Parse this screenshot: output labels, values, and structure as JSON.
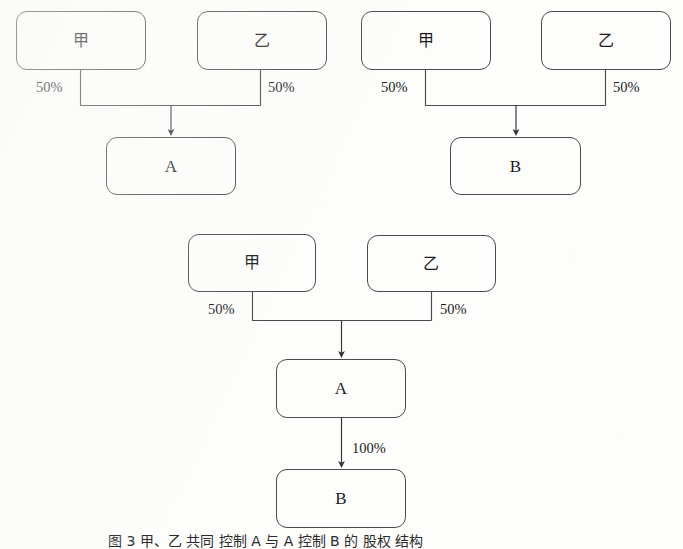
{
  "figure": {
    "caption": "图 3   甲、乙 共同 控制 A 与 A 控制 B 的 股权 结构",
    "background_color": "#fdfdfc",
    "line_color": "#4a4a4a",
    "text_color": "#1d1d1d"
  },
  "diagrams": [
    {
      "id": "diagram-top-left",
      "nodes": [
        {
          "id": "tl-parent-1",
          "label": "甲",
          "script": "cjk",
          "x": 16,
          "y": 11,
          "w": 130,
          "h": 59
        },
        {
          "id": "tl-parent-2",
          "label": "乙",
          "script": "cjk",
          "x": 197,
          "y": 11,
          "w": 130,
          "h": 59
        },
        {
          "id": "tl-child",
          "label": "A",
          "script": "latin",
          "x": 106,
          "y": 137,
          "w": 130,
          "h": 58
        }
      ],
      "edges": [
        {
          "id": "tl-edge-1",
          "from": "tl-parent-1",
          "to": "tl-child",
          "label": "50%",
          "label_side": "left",
          "label_x": 36,
          "label_y": 80
        },
        {
          "id": "tl-edge-2",
          "from": "tl-parent-2",
          "to": "tl-child",
          "label": "50%",
          "label_side": "right",
          "label_x": 268,
          "label_y": 80
        }
      ]
    },
    {
      "id": "diagram-top-right",
      "nodes": [
        {
          "id": "tr-parent-1",
          "label": "甲",
          "script": "cjk",
          "x": 361,
          "y": 11,
          "w": 130,
          "h": 59
        },
        {
          "id": "tr-parent-2",
          "label": "乙",
          "script": "cjk",
          "x": 541,
          "y": 11,
          "w": 130,
          "h": 59
        },
        {
          "id": "tr-child",
          "label": "B",
          "script": "latin",
          "x": 450,
          "y": 137,
          "w": 131,
          "h": 58
        }
      ],
      "edges": [
        {
          "id": "tr-edge-1",
          "from": "tr-parent-1",
          "to": "tr-child",
          "label": "50%",
          "label_side": "left",
          "label_x": 381,
          "label_y": 80
        },
        {
          "id": "tr-edge-2",
          "from": "tr-parent-2",
          "to": "tr-child",
          "label": "50%",
          "label_side": "right",
          "label_x": 613,
          "label_y": 80
        }
      ]
    },
    {
      "id": "diagram-bottom",
      "nodes": [
        {
          "id": "b-parent-1",
          "label": "甲",
          "script": "cjk",
          "x": 188,
          "y": 234,
          "w": 128,
          "h": 58
        },
        {
          "id": "b-parent-2",
          "label": "乙",
          "script": "cjk",
          "x": 367,
          "y": 235,
          "w": 129,
          "h": 57
        },
        {
          "id": "b-mid",
          "label": "A",
          "script": "latin",
          "x": 276,
          "y": 359,
          "w": 130,
          "h": 59
        },
        {
          "id": "b-leaf",
          "label": "B",
          "script": "latin",
          "x": 276,
          "y": 469,
          "w": 130,
          "h": 59
        }
      ],
      "edges": [
        {
          "id": "b-edge-1",
          "from": "b-parent-1",
          "to": "b-mid",
          "label": "50%",
          "label_side": "left",
          "label_x": 208,
          "label_y": 302
        },
        {
          "id": "b-edge-2",
          "from": "b-parent-2",
          "to": "b-mid",
          "label": "50%",
          "label_side": "right",
          "label_x": 440,
          "label_y": 302
        },
        {
          "id": "b-edge-3",
          "from": "b-mid",
          "to": "b-leaf",
          "label": "100%",
          "label_side": "right",
          "label_x": 352,
          "label_y": 441
        }
      ]
    }
  ]
}
